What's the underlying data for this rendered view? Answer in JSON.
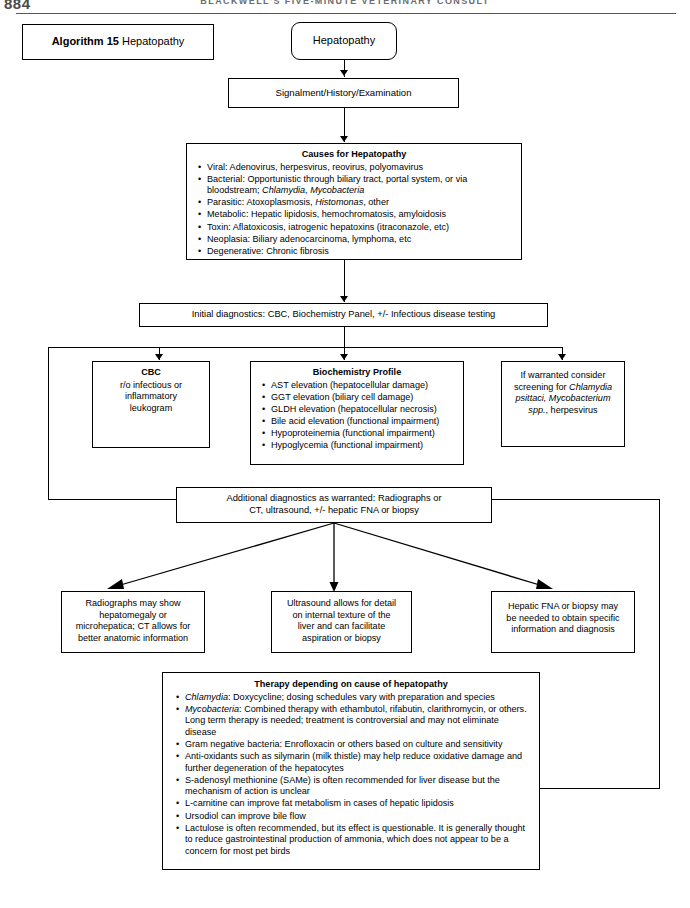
{
  "page": {
    "number": "884",
    "running_head": "BLACKWELL'S FIVE-MINUTE VETERINARY CONSULT"
  },
  "algorithm_label": {
    "prefix": "Algorithm 15",
    "title": "Hepatopathy"
  },
  "nodes": {
    "start": "Hepatopathy",
    "signalment": "Signalment/History/Examination",
    "causes": {
      "title": "Causes for Hepatopathy",
      "items": [
        "Viral: Adenovirus, herpesvirus, reovirus, polyomavirus",
        "Bacterial: Opportunistic through biliary tract, portal system, or via bloodstream; Chlamydia, Mycobacteria",
        "Parasitic: Atoxoplasmosis, Histomonas, other",
        "Metabolic: Hepatic lipidosis, hemochromatosis, amyloidosis",
        "Toxin: Aflatoxicosis, iatrogenic hepatoxins (itraconazole, etc)",
        "Neoplasia: Biliary adenocarcinoma, lymphoma, etc",
        "Degenerative: Chronic fibrosis"
      ]
    },
    "initial_diagnostics": "Initial diagnostics: CBC, Biochemistry Panel, +/- Infectious disease testing",
    "cbc": {
      "title": "CBC",
      "lines": [
        "r/o infectious or",
        "inflammatory",
        "leukogram"
      ]
    },
    "biochemistry": {
      "title": "Biochemistry Profile",
      "items": [
        "AST elevation (hepatocellular damage)",
        "GGT elevation (biliary cell damage)",
        "GLDH elevation (hepatocellular necrosis)",
        "Bile acid elevation (functional impairment)",
        "Hypoproteinemia (functional impairment)",
        "Hypoglycemia (functional impairment)"
      ]
    },
    "screening": {
      "lines": [
        "If warranted consider",
        "screening for Chlamydia",
        "psittaci, Mycobacterium",
        "spp., herpesvirus"
      ]
    },
    "additional_diagnostics": {
      "lines": [
        "Additional diagnostics as warranted: Radiographs or",
        "CT, ultrasound, +/- hepatic FNA or biopsy"
      ]
    },
    "radiographs": {
      "lines": [
        "Radiographs may show",
        "hepatomegaly or",
        "microhepatica; CT allows for",
        "better anatomic information"
      ]
    },
    "ultrasound": {
      "lines": [
        "Ultrasound allows for detail",
        "on internal texture of the",
        "liver and can facilitate",
        "aspiration or biopsy"
      ]
    },
    "fna": {
      "lines": [
        "Hepatic FNA or biopsy may",
        "be needed to obtain specific",
        "information and diagnosis"
      ]
    },
    "therapy": {
      "title": "Therapy depending on cause of hepatopathy",
      "items": [
        "Chlamydia: Doxycycline; dosing schedules vary with preparation and species",
        "Mycobacteria: Combined therapy with ethambutol, rifabutin, clarithromycin, or others. Long term therapy is needed; treatment is controversial and may not eliminate disease",
        "Gram negative bacteria: Enrofloxacin or others based on culture and sensitivity",
        "Anti-oxidants such as silymarin (milk thistle) may help reduce oxidative damage and further degeneration of the hepatocytes",
        "S-adenosyl methionine (SAMe) is often recommended for liver disease but the mechanism of action is unclear",
        "L-carnitine can improve fat metabolism in cases of hepatic lipidosis",
        "Ursodiol can improve bile flow",
        "Lactulose is often recommended, but its effect is questionable. It is generally thought to reduce gastrointestinal production of ammonia, which does not appear to be a concern for most pet birds"
      ]
    }
  },
  "colors": {
    "line": "#000000",
    "header_rule": "#58585a",
    "header_text": "#6b6b6b"
  }
}
